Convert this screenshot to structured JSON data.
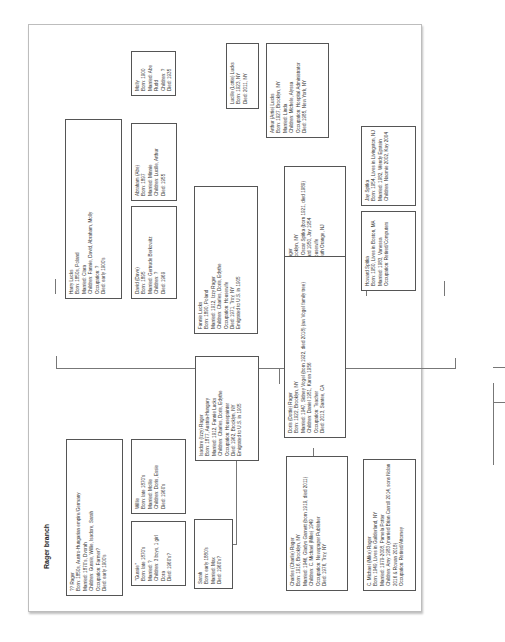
{
  "document": {
    "title": "Rager branch",
    "orientation": "rotated 90° counter-clockwise",
    "people": {
      "rager_patriarch": {
        "lines": [
          "?? Rager",
          "Born: 1850s, Austro-Hungarian empire/Germany",
          "Married: 1870's, Dvorah",
          "Children: Gussie, Willie, Isadore, Sarah",
          "Occupation: Farmer?",
          "Died: early 1900's"
        ]
      },
      "willie": {
        "lines": [
          "Willie",
          "Born: late 1870's",
          "Married: Mollie",
          "Children: Doris, Essie",
          "Died: 1960's"
        ]
      },
      "gussie": {
        "lines": [
          "\"Gussie\"",
          "Born: late 1870's",
          "Married: ?",
          "Children: 3 boys, 1 girl Dora",
          "Died: 1960's?"
        ]
      },
      "sarah": {
        "lines": [
          "Sarah",
          "Born: early 1880's",
          "Married: Max",
          "Died: 1960's?"
        ]
      },
      "isadore": {
        "lines": [
          "Isadore (Izzy) Rager",
          "Born: 1877, Austria-Hungary",
          "Married: 1912, Fannie Lucks",
          "Children: Charles, Doris, Edythe",
          "Occupation: Housepainter",
          "Died: 1962, Brooklyn, NY",
          "Emigrated to U.S. in 1905"
        ]
      },
      "harry_lucks": {
        "lines": [
          "Harry Lucks",
          "Born: 1850s, Poland",
          "Married: Clara",
          "Children: Fannie, David, Abraham, Molly",
          "Occupation: ?",
          "Died: early 1900's"
        ]
      },
      "david": {
        "lines": [
          "David (Dave)",
          "Born: 1895",
          "Married: Gertrude Berkowitz",
          "Children: ?",
          "Died: 1969"
        ]
      },
      "abraham": {
        "lines": [
          "Abraham (Abe)",
          "Born: 1897",
          "Married: Minnie",
          "Children: Lucille, Arthur",
          "Died: 1955"
        ]
      },
      "molly": {
        "lines": [
          "Molly",
          "Born: 1900",
          "Married: Abe Rudd",
          "Children: ?",
          "Died: 1935"
        ]
      },
      "fannie": {
        "lines": [
          "Fannie Lucks",
          "Born: 1890, Poland",
          "Married: 1912, Izzy Rager",
          "Children: Charles, Doris, Edythe",
          "Occupation: Housewife",
          "Died: 1971, Troy, NY",
          "Emigrated to U.S. in 1905"
        ]
      },
      "lucille": {
        "lines": [
          "Lucille (Lottie) Lucks",
          "Born: 1923, NY",
          "Died: 2011, NY"
        ]
      },
      "arthur": {
        "lines": [
          "Arthur (Artie) Lucks",
          "Born: 1927, Brooklyn, NY",
          "Married: Linda",
          "Children: Michele, Alyssa",
          "Occupation: Hospital Administrator",
          "Died: 1985, New York, NY"
        ]
      },
      "edith": {
        "lines": [
          "Edith (Edie) Rager",
          "Born: 1920, Brooklyn, NY",
          "Married: 1947, Oscar Spitka (born 1921, died 1989)",
          "Children: Howard 1950, Jay 1954",
          "Occupation: Housewife",
          "Died: 1969, South Orange, NJ"
        ]
      },
      "doris": {
        "lines": [
          "Doris (Dottie) Rager",
          "Born: 1922, Brooklyn, NY",
          "Married: 1947, Sidney Vogel (born 1922, died 2018) (aw Vogel family tree)",
          "Children: Daniel 1951, Karen 1956",
          "Occupation: Teacher",
          "Died: 2013, Santee, CA"
        ]
      },
      "charles": {
        "lines": [
          "Charles (Charlie) Rager",
          "Born: 1916, Brooklyn, NY",
          "Married: 1946, Gladys Garnett (born 1919, died 2011)",
          "Children: C. Michael (Mike) 1949",
          "Occupation: Newspaper Publisher",
          "Died: 1976, Troy, NY"
        ]
      },
      "jay": {
        "lines": [
          "Jay Spitka",
          "Born: 1954, Lives in Livingston, NJ",
          "Married: 1982, Wendy Epstein",
          "Children: Naomie 2002, Kay 2004"
        ]
      },
      "howard": {
        "lines": [
          "Howard Spitka",
          "Born: 1950, Lives in Boston, MA",
          "Married: 1983, Vanessa",
          "Occupation: Retired/Computers"
        ]
      },
      "c_michael": {
        "lines": [
          "C. Michael (Mike) Rager",
          "Born: 1949, Lives in Guilderland, NY",
          "Married: 1979-2008, Pamela Potter",
          "Children: Amy 1983 (married Brian Carroll 2014, sons Nolan 2016 & Rowan 2018)",
          "Occupation: Retired/Attorney"
        ]
      }
    }
  }
}
